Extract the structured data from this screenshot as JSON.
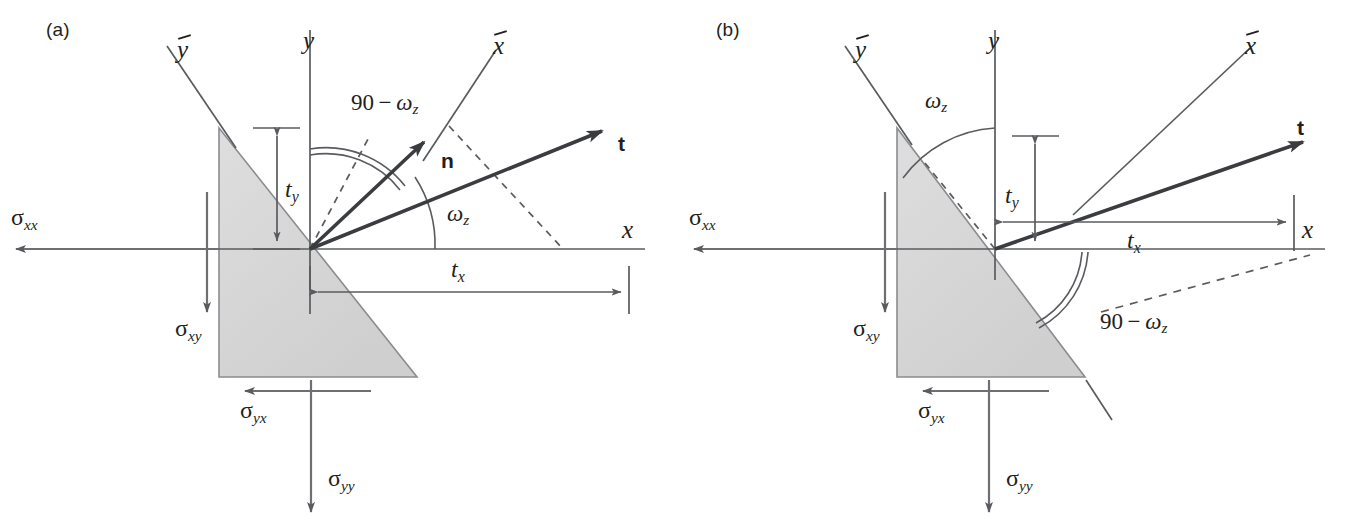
{
  "figure": {
    "type": "technical-diagram",
    "background_color": "#ffffff",
    "stroke_color": "#595b5e",
    "text_color": "#231f20",
    "wedge_fill": "#d9d9d9",
    "wedge_stroke": "#8a8c8f"
  },
  "panels": [
    {
      "tag": "(a)",
      "axes": {
        "y": "y",
        "x": "x",
        "y_bar": "y",
        "x_bar": "x"
      },
      "vectors": {
        "normal": "n",
        "traction": "t"
      },
      "angles": {
        "from_y_axis": {
          "prefix": "90",
          "minus": "−",
          "omega": "ω",
          "sub": "z",
          "full": "90 − ωz"
        },
        "from_x_axis": {
          "omega": "ω",
          "sub": "z",
          "full": "ωz"
        }
      },
      "dimensions": {
        "ty": {
          "symbol": "t",
          "sub": "y"
        },
        "tx": {
          "symbol": "t",
          "sub": "x"
        }
      },
      "stresses": [
        {
          "symbol": "σ",
          "sub": "xx",
          "name": "sigma-xx",
          "direction": "left"
        },
        {
          "symbol": "σ",
          "sub": "xy",
          "name": "sigma-xy",
          "direction": "down"
        },
        {
          "symbol": "σ",
          "sub": "yx",
          "name": "sigma-yx",
          "direction": "left"
        },
        {
          "symbol": "σ",
          "sub": "yy",
          "name": "sigma-yy",
          "direction": "down"
        }
      ]
    },
    {
      "tag": "(b)",
      "axes": {
        "y": "y",
        "x": "x",
        "y_bar": "y",
        "x_bar": "x"
      },
      "vectors": {
        "traction": "t"
      },
      "angles": {
        "from_y_axis": {
          "omega": "ω",
          "sub": "z",
          "full": "ωz"
        },
        "from_x_axis": {
          "prefix": "90",
          "minus": "−",
          "omega": "ω",
          "sub": "z",
          "full": "90 − ωz"
        }
      },
      "dimensions": {
        "ty": {
          "symbol": "t",
          "sub": "y"
        },
        "tx": {
          "symbol": "t",
          "sub": "x"
        }
      },
      "stresses": [
        {
          "symbol": "σ",
          "sub": "xx",
          "name": "sigma-xx",
          "direction": "left"
        },
        {
          "symbol": "σ",
          "sub": "xy",
          "name": "sigma-xy",
          "direction": "down"
        },
        {
          "symbol": "σ",
          "sub": "yx",
          "name": "sigma-yx",
          "direction": "left"
        },
        {
          "symbol": "σ",
          "sub": "yy",
          "name": "sigma-yy",
          "direction": "down"
        }
      ]
    }
  ]
}
